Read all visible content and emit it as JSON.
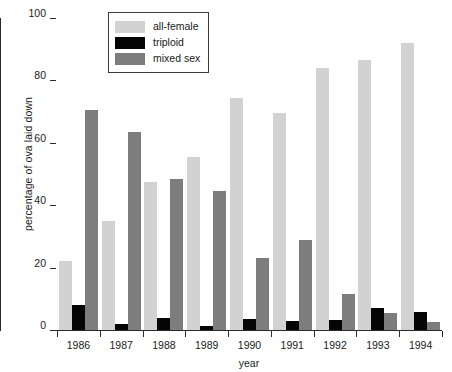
{
  "chart_data": {
    "type": "bar",
    "title": "",
    "xlabel": "year",
    "ylabel": "percentage of ova laid down",
    "categories": [
      "1986",
      "1987",
      "1988",
      "1989",
      "1990",
      "1991",
      "1992",
      "1993",
      "1994"
    ],
    "ylim": [
      0,
      100
    ],
    "yticks": [
      0,
      20,
      40,
      60,
      80,
      100
    ],
    "ytick_labels": [
      "0",
      "20",
      "40",
      "60",
      "80",
      "100"
    ],
    "grid": false,
    "legend_position": "top-center",
    "series": [
      {
        "name": "all-female",
        "color": "#d2d2d2",
        "values": [
          22,
          35,
          47.5,
          55.5,
          74.5,
          69.5,
          84,
          86.5,
          92
        ]
      },
      {
        "name": "triploid",
        "color": "#050505",
        "values": [
          8,
          2,
          4,
          1.2,
          3.5,
          2.8,
          3.3,
          7,
          5.8
        ]
      },
      {
        "name": "mixed sex",
        "color": "#7d7d7d",
        "values": [
          70.5,
          63.5,
          48.5,
          44.5,
          23,
          29,
          11.5,
          5.3,
          2.5
        ]
      }
    ]
  },
  "legend": {
    "items": [
      {
        "label": "all-female",
        "color": "#d2d2d2"
      },
      {
        "label": "triploid",
        "color": "#050505"
      },
      {
        "label": "mixed sex",
        "color": "#7d7d7d"
      }
    ]
  },
  "axes": {
    "y_title": "percentage of ova laid down",
    "x_title": "year"
  }
}
